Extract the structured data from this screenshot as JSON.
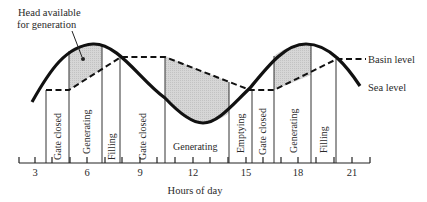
{
  "annotations": {
    "head_line1": "Head available",
    "head_line2": "for generation",
    "basin_level": "Basin level",
    "sea_level": "Sea level"
  },
  "axis": {
    "xlabel": "Hours of day",
    "ticks": [
      "3",
      "6",
      "9",
      "12",
      "15",
      "18",
      "21"
    ]
  },
  "phases": [
    {
      "label": "Gate closed"
    },
    {
      "label": "Generating"
    },
    {
      "label": "Filling"
    },
    {
      "label": "Gate closed"
    },
    {
      "label": "Generating"
    },
    {
      "label": "Emptying"
    },
    {
      "label": "Gate closed"
    },
    {
      "label": "Generating"
    },
    {
      "label": "Filling"
    }
  ],
  "colors": {
    "line": "#111111",
    "shade": "#d4d4d4",
    "divider": "#333333"
  }
}
